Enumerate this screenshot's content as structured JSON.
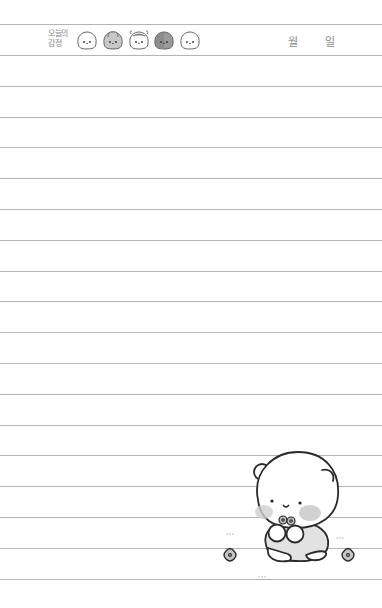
{
  "header": {
    "label_line1": "오늘의",
    "label_line2": "감정",
    "month_label": "월",
    "day_label": "일",
    "month_value": "",
    "day_value": ""
  },
  "emotions": [
    {
      "name": "happy",
      "icon": "bear-face-happy-icon",
      "shade": "none",
      "face": "·o·"
    },
    {
      "name": "sad",
      "icon": "bear-face-sad-icon",
      "shade": "#c8c8c8",
      "face": "•ᴗ•"
    },
    {
      "name": "surprised",
      "icon": "bear-face-surprised-icon",
      "shade": "none",
      "face": "•ᴥ•"
    },
    {
      "name": "angry",
      "icon": "bear-face-angry-icon",
      "shade": "#9a9a9a",
      "face": "•ᴗ•"
    },
    {
      "name": "calm",
      "icon": "bear-face-calm-icon",
      "shade": "none",
      "face": "·ᴗ·"
    }
  ],
  "lines": {
    "count": 18,
    "first_y": 55,
    "spacing": 30.8,
    "top_rule_y": 24,
    "color": "#b4b4b4"
  },
  "illustration": {
    "subject": "bear-holding-flowers",
    "flowers": 3
  }
}
